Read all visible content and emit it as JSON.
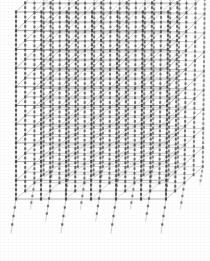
{
  "figure": {
    "view": "three-dimensional perspective wireframe",
    "render_style": "scanned monochrome line drawing",
    "background_color": "#ffffff",
    "line_color": "#6e6e6e",
    "beam_color": "#7a7a7a",
    "column_color": "#8a8a8a",
    "node_color": "#3a3a3a",
    "canvas": {
      "width": 210,
      "height": 261
    }
  },
  "chart_data": {
    "type": "scatter",
    "xlabel": "",
    "ylabel": "",
    "grid": false,
    "legend": null
  },
  "model": {
    "stories": 10,
    "bays_x": 6,
    "bays_y": 4,
    "grid_columns_x": 7,
    "grid_columns_y": 5,
    "node_marks_per_member": 3,
    "base_extension": true,
    "base_extension_label": "pile / column extension below base"
  },
  "geometry": {
    "origin_x": 16,
    "origin_y": 199,
    "bay_width_x": 25.0,
    "bay_depth_x": 9.2,
    "bay_depth_y": -8.1,
    "story_height": 18.7,
    "top_skew": 2.2,
    "pile_length": 34,
    "pile_dx": -5
  }
}
